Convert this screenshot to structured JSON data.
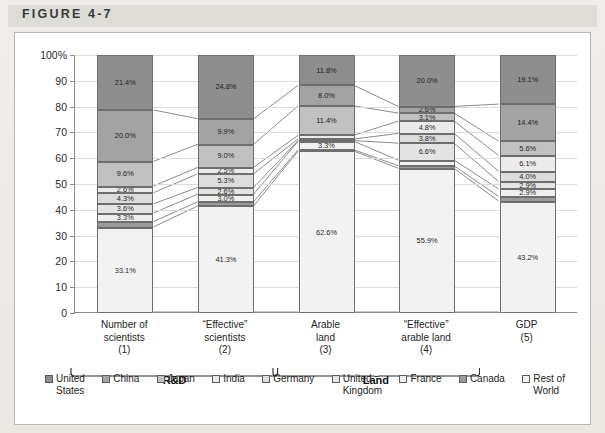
{
  "figure": {
    "title": "FIGURE 4-7"
  },
  "axis": {
    "y_ticks": [
      "100%",
      "90",
      "80",
      "70",
      "60",
      "50",
      "40",
      "30",
      "20",
      "10",
      "0"
    ],
    "y_values": [
      100,
      90,
      80,
      70,
      60,
      50,
      40,
      30,
      20,
      10,
      0
    ]
  },
  "groups": [
    {
      "label": "R&D",
      "bars": [
        0,
        1
      ]
    },
    {
      "label": "Land",
      "bars": [
        2,
        3
      ]
    }
  ],
  "legend": {
    "items": [
      {
        "name": "United States",
        "display": "United\nStates",
        "color": "#8e8e8e"
      },
      {
        "name": "China",
        "display": "China",
        "color": "#a3a3a3"
      },
      {
        "name": "Japan",
        "display": "Japan",
        "color": "#c0c0c0"
      },
      {
        "name": "India",
        "display": "India",
        "color": "#ebebeb"
      },
      {
        "name": "Germany",
        "display": "Germany",
        "color": "#dcdcdc"
      },
      {
        "name": "United Kingdom",
        "display": "United\nKingdom",
        "color": "#e4e4e4"
      },
      {
        "name": "France",
        "display": "France",
        "color": "#efefef"
      },
      {
        "name": "Canada",
        "display": "Canada",
        "color": "#9a9a9a"
      },
      {
        "name": "Rest of World",
        "display": "Rest of\nWorld",
        "color": "#f2f2f2"
      }
    ]
  },
  "chart_data": {
    "type": "bar",
    "subtype": "stacked-percent-with-links",
    "title": "FIGURE 4-7",
    "xlabel": "",
    "ylabel": "",
    "ylim": [
      0,
      100
    ],
    "grid": true,
    "legend_position": "bottom",
    "categories": [
      "Number of scientists (1)",
      "“Effective” scientists (2)",
      "Arable land (3)",
      "“Effective” arable land (4)",
      "GDP (5)"
    ],
    "category_lines": [
      [
        "Number of",
        "scientists",
        "(1)"
      ],
      [
        "“Effective”",
        "scientists",
        "(2)"
      ],
      [
        "Arable",
        "land",
        "(3)"
      ],
      [
        "“Effective”",
        "arable land",
        "(4)"
      ],
      [
        "GDP",
        "(5)"
      ]
    ],
    "series": [
      {
        "name": "United States",
        "values": [
          21.4,
          24.8,
          11.8,
          20.0,
          19.1
        ]
      },
      {
        "name": "China",
        "values": [
          20.0,
          9.9,
          8.0,
          2.6,
          14.4
        ]
      },
      {
        "name": "Japan",
        "values": [
          9.6,
          9.0,
          11.4,
          3.1,
          5.6
        ]
      },
      {
        "name": "India",
        "values": [
          2.6,
          2.5,
          1.5,
          4.8,
          6.1
        ]
      },
      {
        "name": "Germany",
        "values": [
          4.3,
          5.3,
          0.6,
          3.8,
          4.0
        ]
      },
      {
        "name": "United Kingdom",
        "values": [
          3.6,
          2.6,
          0.3,
          6.6,
          2.9
        ]
      },
      {
        "name": "France",
        "values": [
          3.3,
          3.0,
          3.3,
          2.2,
          2.9
        ]
      },
      {
        "name": "Canada",
        "values": [
          2.1,
          1.6,
          0.5,
          1.0,
          1.8
        ]
      },
      {
        "name": "Rest of World",
        "values": [
          33.1,
          41.3,
          62.6,
          55.9,
          43.2
        ]
      }
    ],
    "labels": [
      [
        "21.4%",
        "20.0%",
        "9.6%",
        "2.6%",
        "4.3%",
        "3.6%",
        "3.3%",
        "",
        "33.1%"
      ],
      [
        "24.8%",
        "9.9%",
        "9.0%",
        "2.5%",
        "5.3%",
        "2.6%",
        "3.0%",
        "",
        "41.3%"
      ],
      [
        "11.8%",
        "8.0%",
        "11.4%",
        "",
        "",
        "",
        "3.3%",
        "",
        "62.6%"
      ],
      [
        "20.0%",
        "2.6%",
        "3.1%",
        "4.8%",
        "3.8%",
        "6.6%",
        "",
        "",
        "55.9%"
      ],
      [
        "19.1%",
        "14.4%",
        "5.6%",
        "6.1%",
        "4.0%",
        "2.9%",
        "2.9%",
        "",
        "43.2%"
      ]
    ]
  }
}
